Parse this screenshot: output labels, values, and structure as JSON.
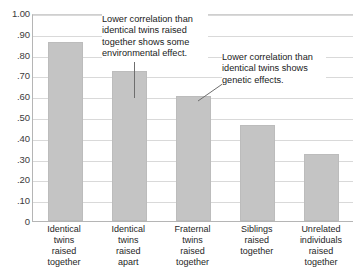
{
  "chart_data": {
    "type": "bar",
    "title": "",
    "xlabel": "",
    "ylabel": "",
    "ylim": [
      0,
      1.0
    ],
    "grid": true,
    "legend": "none",
    "bar_color": "#c4c4c4",
    "categories": [
      "Identical\ntwins\nraised\ntogether",
      "Identical\ntwins\nraised\napart",
      "Fraternal\ntwins\nraised\ntogether",
      "Siblings\nraised\ntogether",
      "Unrelated\nindividuals\nraised\ntogether"
    ],
    "category_lines": [
      [
        "Identical",
        "twins",
        "raised",
        "together"
      ],
      [
        "Identical",
        "twins",
        "raised",
        "apart"
      ],
      [
        "Fraternal",
        "twins",
        "raised",
        "together"
      ],
      [
        "Siblings",
        "raised",
        "together"
      ],
      [
        "Unrelated",
        "individuals",
        "raised",
        "together"
      ]
    ],
    "values": [
      0.86,
      0.72,
      0.6,
      0.46,
      0.32
    ],
    "ytick_labels": [
      "1.00",
      ".90",
      ".80",
      ".70",
      ".60",
      ".50",
      ".40",
      ".30",
      ".20",
      ".10",
      "0"
    ],
    "ytick_values": [
      1.0,
      0.9,
      0.8,
      0.7,
      0.6,
      0.5,
      0.4,
      0.3,
      0.2,
      0.1,
      0
    ],
    "annotations": [
      {
        "id": "annotation-1",
        "text": "Lower correlation than identical twins raised together shows some environmental effect.",
        "points_to_category": "Identical twins raised apart"
      },
      {
        "id": "annotation-2",
        "text": "Lower correlation than identical twins shows genetic effects.",
        "points_to_category": "Fraternal twins raised together"
      }
    ]
  }
}
